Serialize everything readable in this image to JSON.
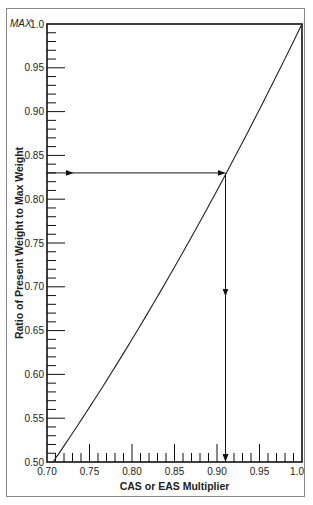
{
  "chart_data": {
    "type": "line",
    "title": "",
    "xlabel": "CAS or EAS Multiplier",
    "ylabel": "Ratio of Present Weight to Max Weight",
    "xlim": [
      0.7,
      1.0
    ],
    "ylim": [
      0.5,
      1.0
    ],
    "x_tick_labels": [
      "0.70",
      "0.75",
      "0.80",
      "0.85",
      "0.90",
      "0.95",
      "1.0"
    ],
    "y_tick_labels": [
      "0.50",
      "0.55",
      "0.60",
      "0.65",
      "0.70",
      "0.75",
      "0.80",
      "0.85",
      "0.90",
      "0.95",
      "1.0"
    ],
    "y_max_annotation": "MAX",
    "minor_tick_step": 0.01,
    "grid": false,
    "series": [
      {
        "name": "Weight ratio vs speed multiplier",
        "x": [
          0.707,
          0.75,
          0.8,
          0.85,
          0.9,
          0.91,
          0.95,
          1.0
        ],
        "y": [
          0.5,
          0.5625,
          0.64,
          0.7225,
          0.81,
          0.83,
          0.9025,
          1.0
        ]
      }
    ],
    "example_reading": {
      "ratio": 0.83,
      "multiplier": 0.91,
      "description": "Arrow from y-axis at 0.83 to curve, then down to x-axis at ~0.91"
    }
  }
}
